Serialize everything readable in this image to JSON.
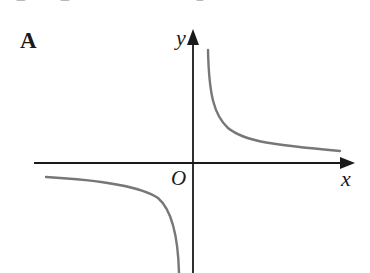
{
  "figure": {
    "panel_label": "A",
    "axes": {
      "x_label": "x",
      "y_label": "y",
      "origin_label": "O"
    },
    "colors": {
      "axis": "#1a1a1a",
      "curve": "#777777",
      "background": "#ffffff"
    },
    "curve": {
      "description": "Rectangular hyperbola y = k/x with k > 0; branches in first and third quadrants",
      "upper_branch_path": "M 208 50 C 209 95, 214 115, 228 128 C 245 142, 275 145, 340 151",
      "lower_branch_path": "M 46 177 C 100 180, 140 186, 158 198 C 172 210, 178 235, 179 273"
    },
    "geometry": {
      "x_axis": {
        "x1": 34,
        "x2": 343,
        "y": 163,
        "arrow_tip_x": 355
      },
      "y_axis": {
        "x": 193,
        "y1": 273,
        "y2": 44,
        "arrow_tip_y": 29
      }
    }
  }
}
